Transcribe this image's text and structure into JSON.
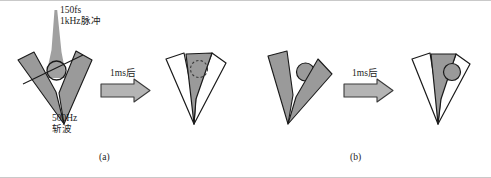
{
  "figure": {
    "caption_a": "(a)",
    "caption_b": "(b)",
    "panels": [
      {
        "id": "a",
        "caption": "(a)",
        "transition_label": "1ms后",
        "annotations": [
          {
            "name": "laser-beam",
            "line1": "150fs",
            "line2": "1kHz脉冲"
          },
          {
            "name": "chopper-wave",
            "line1": "500Hz",
            "line2": "斩波"
          }
        ]
      },
      {
        "id": "b",
        "caption": "(b)",
        "transition_label": "1ms后",
        "annotations": []
      }
    ],
    "labels": {
      "beam_line1": "150fs",
      "beam_line2": "1kHz脉冲",
      "chopper_line1": "500Hz",
      "chopper_line2": "斩波",
      "arrow_a": "1ms后",
      "arrow_b": "1ms后"
    },
    "colors": {
      "blade_fill": "#9a9a9a",
      "blade_stroke": "#1a1a1a",
      "blade_open_fill": "#ffffff",
      "beam_fill": "#a0a0a0",
      "arrow_fill": "#b4b4b4",
      "arrow_stroke": "#3a3a3a",
      "spot_stroke": "#1a1a1a",
      "background": "#ffffff",
      "frame": "#c9c9c9",
      "text": "#1b1b1b"
    }
  }
}
